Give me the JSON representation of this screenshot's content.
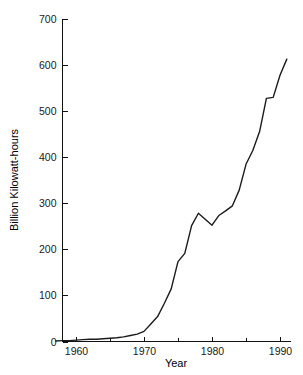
{
  "chart_data": {
    "type": "line",
    "title": "",
    "xlabel": "Year",
    "ylabel": "Billion Kilowatt-hours",
    "xlim": [
      1957,
      1991
    ],
    "ylim": [
      0,
      700
    ],
    "grid": false,
    "legend": null,
    "x_ticks_major": [
      1960,
      1970,
      1980,
      1990
    ],
    "x_tick_labels": [
      "1960",
      "1970",
      "1980",
      "1990"
    ],
    "x_ticks_minor": [
      1965,
      1975,
      1985
    ],
    "y_ticks": [
      0,
      100,
      200,
      300,
      400,
      500,
      600,
      700
    ],
    "y_tick_labels": [
      "0",
      "100",
      "200",
      "300",
      "400",
      "500",
      "600",
      "700"
    ],
    "line_color": "#1b1b1b",
    "background_color": "#ffffff",
    "series": [
      {
        "name": "Nuclear electricity generation",
        "x": [
          1957,
          1958,
          1959,
          1960,
          1961,
          1962,
          1963,
          1964,
          1965,
          1966,
          1967,
          1968,
          1969,
          1970,
          1971,
          1972,
          1973,
          1974,
          1975,
          1976,
          1977,
          1978,
          1979,
          1980,
          1981,
          1982,
          1983,
          1984,
          1985,
          1986,
          1987,
          1988,
          1989,
          1990,
          1991
        ],
        "y": [
          1,
          2,
          2,
          3,
          4,
          5,
          5,
          6,
          7,
          8,
          10,
          13,
          16,
          22,
          38,
          54,
          83,
          114,
          173,
          191,
          251,
          278,
          265,
          252,
          273,
          283,
          294,
          328,
          384,
          414,
          455,
          527,
          529,
          577,
          612
        ]
      }
    ]
  },
  "axis_labels": {
    "y_title": "Billion Kilowatt-hours",
    "x_title": "Year"
  }
}
